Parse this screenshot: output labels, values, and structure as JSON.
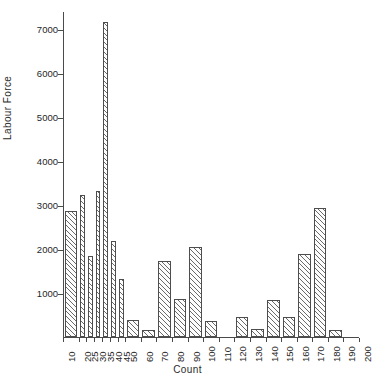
{
  "chart_data": {
    "type": "bar",
    "title": "",
    "xlabel": "Count",
    "ylabel": "Labour Force",
    "ylim": [
      0,
      7400
    ],
    "xlim": [
      10,
      200
    ],
    "grid": false,
    "legend": null,
    "y_ticks": [
      1000,
      2000,
      3000,
      4000,
      5000,
      6000,
      7000
    ],
    "x_ticks": [
      10,
      20,
      25,
      30,
      35,
      40,
      45,
      50,
      60,
      70,
      80,
      90,
      100,
      110,
      120,
      130,
      140,
      150,
      160,
      170,
      180,
      190,
      200
    ],
    "bins": [
      {
        "label": "10-20",
        "start": 10,
        "end": 20,
        "value": 2870
      },
      {
        "label": "20-25",
        "start": 20,
        "end": 25,
        "value": 3230
      },
      {
        "label": "25-30",
        "start": 25,
        "end": 30,
        "value": 1840
      },
      {
        "label": "30-35",
        "start": 30,
        "end": 35,
        "value": 3310
      },
      {
        "label": "35-40",
        "start": 35,
        "end": 40,
        "value": 7150
      },
      {
        "label": "40-45",
        "start": 40,
        "end": 45,
        "value": 2180
      },
      {
        "label": "45-50",
        "start": 45,
        "end": 50,
        "value": 1320
      },
      {
        "label": "50-60",
        "start": 50,
        "end": 60,
        "value": 390
      },
      {
        "label": "60-70",
        "start": 60,
        "end": 70,
        "value": 150
      },
      {
        "label": "70-80",
        "start": 70,
        "end": 80,
        "value": 1720
      },
      {
        "label": "80-90",
        "start": 80,
        "end": 90,
        "value": 870
      },
      {
        "label": "90-100",
        "start": 90,
        "end": 100,
        "value": 2050
      },
      {
        "label": "100-110",
        "start": 100,
        "end": 110,
        "value": 370
      },
      {
        "label": "110-120",
        "start": 110,
        "end": 120,
        "value": 0
      },
      {
        "label": "120-130",
        "start": 120,
        "end": 130,
        "value": 460
      },
      {
        "label": "130-140",
        "start": 130,
        "end": 140,
        "value": 180
      },
      {
        "label": "140-150",
        "start": 140,
        "end": 150,
        "value": 830
      },
      {
        "label": "150-160",
        "start": 150,
        "end": 160,
        "value": 460
      },
      {
        "label": "160-170",
        "start": 160,
        "end": 170,
        "value": 1880
      },
      {
        "label": "170-180",
        "start": 170,
        "end": 180,
        "value": 2930
      },
      {
        "label": "180-190",
        "start": 180,
        "end": 190,
        "value": 160
      },
      {
        "label": "190-200",
        "start": 190,
        "end": 200,
        "value": 0
      }
    ],
    "colors": {
      "bar_edge": "#4d4d4d",
      "bar_hatch": "#505050",
      "bar_fill": "#fdfdfd",
      "axis": "#4a4a4a",
      "text": "#262626",
      "background": "#ffffff"
    }
  }
}
